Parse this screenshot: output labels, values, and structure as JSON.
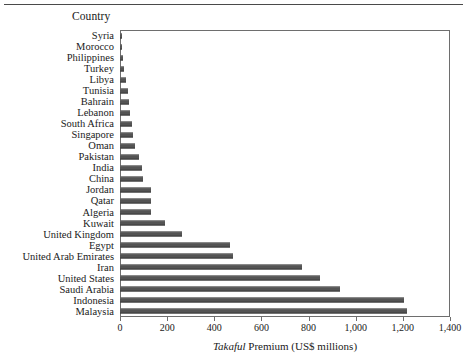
{
  "chart_data": {
    "type": "bar",
    "orientation": "horizontal",
    "title": "",
    "xlabel": "Takaful Premium (US$ millions)",
    "xlabel_italic_word": "Takaful",
    "xlabel_rest": " Premium (US$ millions)",
    "ylabel": "Country",
    "xlim": [
      0,
      1400
    ],
    "xticks": [
      0,
      200,
      400,
      600,
      800,
      1000,
      1200,
      1400
    ],
    "xticklabels": [
      "0",
      "200",
      "400",
      "600",
      "800",
      "1,000",
      "1,200",
      "1,400"
    ],
    "grid": false,
    "legend": null,
    "bar_color": "#545454",
    "categories": [
      "Syria",
      "Morocco",
      "Philippines",
      "Turkey",
      "Libya",
      "Tunisia",
      "Bahrain",
      "Lebanon",
      "South Africa",
      "Singapore",
      "Oman",
      "Pakistan",
      "India",
      "China",
      "Jordan",
      "Qatar",
      "Algeria",
      "Kuwait",
      "United Kingdom",
      "Egypt",
      "United Arab Emirates",
      "Iran",
      "United States",
      "Saudi Arabia",
      "Indonesia",
      "Malaysia"
    ],
    "values": [
      8,
      10,
      12,
      18,
      24,
      33,
      38,
      42,
      50,
      57,
      65,
      82,
      92,
      99,
      130,
      132,
      133,
      192,
      262,
      466,
      478,
      772,
      848,
      933,
      1203,
      1218
    ]
  },
  "axis_header": {
    "label": "Country"
  }
}
